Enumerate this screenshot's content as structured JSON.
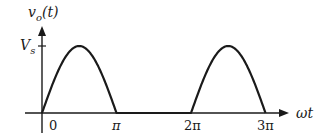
{
  "diagram": {
    "y_axis_label": "v",
    "y_axis_label_sub": "o",
    "y_axis_label_arg": "(t)",
    "x_axis_label": "ωt",
    "level_label": "V",
    "level_label_sub": "s",
    "x_ticks": [
      "0",
      "π",
      "2π",
      "3π"
    ],
    "stroke_color": "#1a1a1a"
  },
  "chart_data": {
    "type": "line",
    "title": "",
    "xlabel": "ωt",
    "ylabel": "v_o(t)",
    "x_tick_labels": [
      "0",
      "π",
      "2π",
      "3π"
    ],
    "y_tick_labels": [
      "V_s"
    ],
    "series": [
      {
        "name": "v_o(t)",
        "description": "Half-wave rectified sine: Vs·sin(ωt) for sin>0, 0 otherwise",
        "x": [
          "0",
          "π/2",
          "π",
          "3π/2",
          "2π",
          "5π/2",
          "3π"
        ],
        "values": [
          "0",
          "Vs",
          "0",
          "0",
          "0",
          "Vs",
          "0"
        ]
      }
    ],
    "grid": false,
    "legend": "none"
  }
}
